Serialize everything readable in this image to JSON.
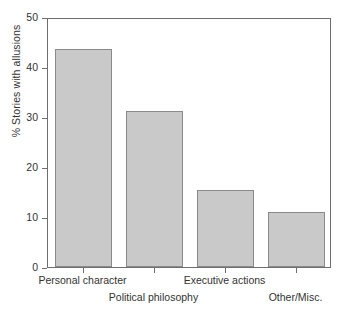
{
  "chart_data": {
    "type": "bar",
    "title": "",
    "xlabel": "",
    "ylabel": "% Stories with allusions",
    "categories": [
      "Personal character",
      "Political philosophy",
      "Executive actions",
      "Other/Misc."
    ],
    "values": [
      43.7,
      31.3,
      15.5,
      11.0
    ],
    "ylim": [
      0,
      50
    ],
    "yticks": [
      0,
      10,
      20,
      30,
      40,
      50
    ],
    "ytick_labels": [
      "0",
      "10",
      "20",
      "30",
      "40",
      "50"
    ],
    "grid": false,
    "legend": "none",
    "bar_fill_color": "#c9c9c9",
    "bar_edge_color": "#8a8a8a",
    "axis_color": "#6e6e6e",
    "label_rows": [
      1,
      2,
      1,
      2
    ]
  },
  "axes": {
    "y_title": "% Stories with allusions"
  }
}
